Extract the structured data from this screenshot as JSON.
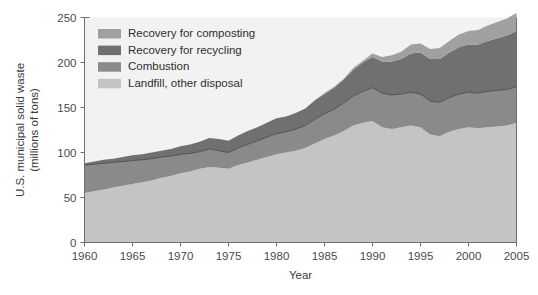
{
  "chart_data": {
    "type": "area",
    "stacked": true,
    "title": "",
    "xlabel": "Year",
    "ylabel": "U.S. municipal solid waste (millions of tons)",
    "ylabel_lines": [
      "U.S. municipal solid waste",
      "(millions of tons)"
    ],
    "xlim": [
      1960,
      2005
    ],
    "ylim": [
      0,
      250
    ],
    "yticks": [
      0,
      50,
      100,
      150,
      200,
      250
    ],
    "xticks": [
      1960,
      1965,
      1970,
      1975,
      1980,
      1985,
      1990,
      1995,
      2000,
      2005
    ],
    "ytick_labels": [
      "0",
      "50",
      "100",
      "150",
      "200",
      "250"
    ],
    "xtick_labels": [
      "1960",
      "1965",
      "1970",
      "1975",
      "1980",
      "1985",
      "1990",
      "1995",
      "2000",
      "2005"
    ],
    "grid": false,
    "legend_position": "top-left",
    "plot_background": "#f2f2f2",
    "x": [
      1960,
      1961,
      1962,
      1963,
      1964,
      1965,
      1966,
      1967,
      1968,
      1969,
      1970,
      1971,
      1972,
      1973,
      1974,
      1975,
      1976,
      1977,
      1978,
      1979,
      1980,
      1981,
      1982,
      1983,
      1984,
      1985,
      1986,
      1987,
      1988,
      1989,
      1990,
      1991,
      1992,
      1993,
      1994,
      1995,
      1996,
      1997,
      1998,
      1999,
      2000,
      2001,
      2002,
      2003,
      2004,
      2005
    ],
    "series": [
      {
        "name": "Landfill, other disposal",
        "color": "#c4c4c4",
        "values": [
          55,
          57,
          59,
          61,
          63,
          65,
          67,
          69,
          72,
          74,
          77,
          79,
          82,
          84,
          83,
          82,
          86,
          89,
          92,
          95,
          98,
          100,
          102,
          105,
          110,
          115,
          119,
          124,
          130,
          133,
          135,
          128,
          126,
          128,
          130,
          128,
          120,
          118,
          123,
          126,
          128,
          127,
          128,
          129,
          130,
          133
        ]
      },
      {
        "name": "Combustion",
        "color": "#8a8a8a",
        "values": [
          31,
          30,
          29,
          28,
          27,
          26,
          25,
          24,
          23,
          22,
          21,
          20,
          19,
          20,
          19,
          18,
          19,
          20,
          21,
          22,
          23,
          23,
          24,
          25,
          27,
          28,
          29,
          31,
          33,
          35,
          37,
          38,
          38,
          37,
          37,
          37,
          37,
          38,
          38,
          39,
          39,
          39,
          40,
          40,
          40,
          40
        ]
      },
      {
        "name": "Recovery for recycling",
        "color": "#707070",
        "values": [
          2,
          3,
          4,
          4,
          5,
          6,
          6,
          7,
          7,
          8,
          9,
          10,
          11,
          12,
          13,
          13,
          14,
          15,
          15,
          16,
          17,
          17,
          18,
          19,
          21,
          22,
          24,
          26,
          29,
          32,
          34,
          35,
          37,
          39,
          43,
          46,
          47,
          48,
          50,
          52,
          53,
          54,
          56,
          58,
          60,
          62
        ]
      },
      {
        "name": "Recovery for composting",
        "color": "#a0a0a0",
        "values": [
          0,
          0,
          0,
          0,
          0,
          0,
          0,
          0,
          0,
          0,
          0,
          0,
          0,
          0,
          0,
          0,
          0,
          0,
          0,
          0,
          0,
          0,
          0,
          0,
          0,
          1,
          1,
          1,
          2,
          2,
          4,
          5,
          7,
          8,
          10,
          10,
          11,
          12,
          13,
          14,
          15,
          16,
          17,
          18,
          19,
          20
        ]
      }
    ],
    "legend": [
      {
        "label": "Recovery for composting",
        "color": "#a0a0a0"
      },
      {
        "label": "Recovery for recycling",
        "color": "#707070"
      },
      {
        "label": "Combustion",
        "color": "#8a8a8a"
      },
      {
        "label": "Landfill, other disposal",
        "color": "#c4c4c4"
      }
    ]
  }
}
